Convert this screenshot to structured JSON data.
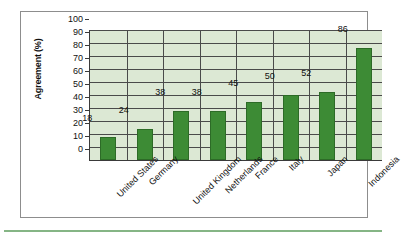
{
  "chart_data": {
    "type": "bar",
    "title": "",
    "xlabel": "",
    "ylabel": "Agreement (%)",
    "ylim": [
      0,
      100
    ],
    "ytick_step": 10,
    "yticks": [
      100,
      90,
      80,
      70,
      60,
      50,
      40,
      30,
      20,
      10,
      0
    ],
    "grid": true,
    "legend": "none",
    "categories": [
      "United States",
      "Germany",
      "United Kingdom",
      "Netherlands",
      "France",
      "Italy",
      "Japan",
      "Indonesia"
    ],
    "values": [
      18,
      24,
      38,
      38,
      45,
      50,
      52,
      86
    ],
    "value_labels": [
      "18",
      "24",
      "38",
      "38",
      "45",
      "50",
      "52",
      "86"
    ],
    "colors": {
      "bar_fill": "#3d8b35",
      "bar_stroke": "#2d6b27",
      "plot_background": "#dce8d4",
      "gridline": "#4a4a4a",
      "axis": "#3a3a3a",
      "frame": "#8d8d8d",
      "accent_rule": "#85b585",
      "page_background": "#ffffff",
      "text": "#111111"
    }
  }
}
